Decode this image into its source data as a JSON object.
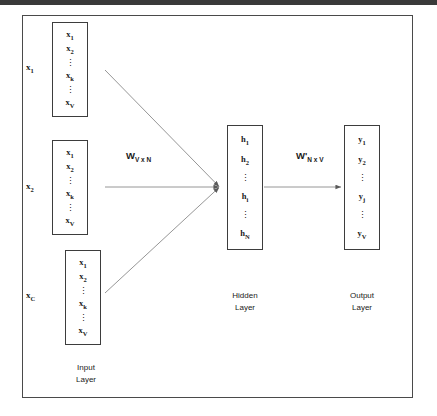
{
  "figure": {
    "colors": {
      "stroke": "#3d3d3d",
      "frame": "#4a4a4a",
      "edge": "#808080",
      "text": "#1a1a1a",
      "background": "#ffffff",
      "top_band": "#3a3a3a"
    }
  },
  "input_layer": {
    "caption": "Input\nLayer",
    "caption_line1": "Input",
    "caption_line2": "Layer",
    "groups": [
      {
        "label": "x",
        "label_sub": "1",
        "cells": [
          {
            "base": "x",
            "sub": "1"
          },
          {
            "base": "x",
            "sub": "2"
          },
          {
            "dots": "⋮"
          },
          {
            "base": "x",
            "sub": "k"
          },
          {
            "dots": "⋮"
          },
          {
            "base": "x",
            "sub": "V"
          }
        ]
      },
      {
        "label": "x",
        "label_sub": "2",
        "cells": [
          {
            "base": "x",
            "sub": "1"
          },
          {
            "base": "x",
            "sub": "2"
          },
          {
            "dots": "⋮"
          },
          {
            "base": "x",
            "sub": "k"
          },
          {
            "dots": "⋮"
          },
          {
            "base": "x",
            "sub": "V"
          }
        ]
      },
      {
        "label": "x",
        "label_sub": "C",
        "cells": [
          {
            "base": "x",
            "sub": "1"
          },
          {
            "base": "x",
            "sub": "2"
          },
          {
            "dots": "⋮"
          },
          {
            "base": "x",
            "sub": "k"
          },
          {
            "dots": "⋮"
          },
          {
            "base": "x",
            "sub": "V"
          }
        ]
      }
    ]
  },
  "hidden_layer": {
    "caption_line1": "Hidden",
    "caption_line2": "Layer",
    "cells": [
      {
        "base": "h",
        "sub": "1"
      },
      {
        "base": "h",
        "sub": "2"
      },
      {
        "dots": "⋮"
      },
      {
        "base": "h",
        "sub": "i"
      },
      {
        "dots": "⋮"
      },
      {
        "base": "h",
        "sub": "N"
      }
    ]
  },
  "output_layer": {
    "caption_line1": "Output",
    "caption_line2": "Layer",
    "cells": [
      {
        "base": "y",
        "sub": "1"
      },
      {
        "base": "y",
        "sub": "2"
      },
      {
        "dots": "⋮"
      },
      {
        "base": "y",
        "sub": "j"
      },
      {
        "dots": "⋮"
      },
      {
        "base": "y",
        "sub": "V"
      }
    ]
  },
  "weights": {
    "input_to_hidden": {
      "base": "W",
      "sub": "V x N"
    },
    "hidden_to_output": {
      "base": "W'",
      "sub": "N x V"
    }
  }
}
